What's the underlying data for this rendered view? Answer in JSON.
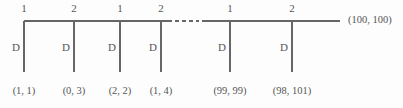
{
  "diagram": {
    "stroke_color": "#666666",
    "text_color": "#555555",
    "background_color": "#fdfdfd",
    "trunk": {
      "y": 21,
      "x_start": 24,
      "x_end": 340,
      "gap_start": 172,
      "gap_end": 202,
      "ellipsis_symbol": "----"
    },
    "end_label": "(100, 100)",
    "nodes": [
      {
        "x": 24,
        "top_label": "1",
        "branch_label": "D",
        "leaf_label": "(1, 1)"
      },
      {
        "x": 74,
        "top_label": "2",
        "branch_label": "D",
        "leaf_label": "(0, 3)"
      },
      {
        "x": 120,
        "top_label": "1",
        "branch_label": "D",
        "leaf_label": "(2, 2)"
      },
      {
        "x": 161,
        "top_label": "2",
        "branch_label": "D",
        "leaf_label": "(1, 4)"
      },
      {
        "x": 230,
        "top_label": "1",
        "branch_label": "D",
        "leaf_label": "(99, 99)"
      },
      {
        "x": 292,
        "top_label": "2",
        "branch_label": "D",
        "leaf_label": "(98, 101)"
      }
    ],
    "branch_bottom_y": 72,
    "top_label_y": 3,
    "branch_label_y": 42,
    "leaf_label_y": 86
  }
}
